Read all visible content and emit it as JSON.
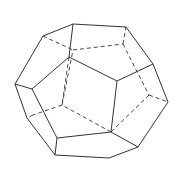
{
  "figure": {
    "title": "",
    "shape": "dodecahedron",
    "stroke_color": "#333333",
    "background": "#ffffff",
    "vertices": {
      "A": [
        43,
        36
      ],
      "B": [
        73,
        24
      ],
      "C": [
        126,
        27
      ],
      "D": [
        153,
        64
      ],
      "E": [
        168,
        102
      ],
      "F": [
        138,
        147
      ],
      "G": [
        109,
        158
      ],
      "H": [
        55,
        155
      ],
      "I": [
        27,
        118
      ],
      "J": [
        15,
        84
      ],
      "K": [
        69,
        57
      ],
      "L": [
        117,
        81
      ],
      "M": [
        111,
        132
      ],
      "N": [
        57,
        138
      ],
      "O": [
        32,
        89
      ],
      "P": [
        73,
        50
      ],
      "Q": [
        123,
        44
      ],
      "R": [
        149,
        95
      ],
      "S": [
        62,
        105
      ],
      "T": [
        33,
        115
      ]
    },
    "solid_edges": [
      [
        "A",
        "B"
      ],
      [
        "B",
        "C"
      ],
      [
        "C",
        "D"
      ],
      [
        "D",
        "E"
      ],
      [
        "E",
        "F"
      ],
      [
        "F",
        "G"
      ],
      [
        "G",
        "H"
      ],
      [
        "H",
        "I"
      ],
      [
        "I",
        "J"
      ],
      [
        "J",
        "A"
      ],
      [
        "B",
        "K"
      ],
      [
        "K",
        "L"
      ],
      [
        "L",
        "D"
      ],
      [
        "L",
        "M"
      ],
      [
        "M",
        "F"
      ],
      [
        "M",
        "N"
      ],
      [
        "N",
        "H"
      ],
      [
        "N",
        "O"
      ],
      [
        "O",
        "J"
      ],
      [
        "O",
        "K"
      ]
    ],
    "hidden_edges": [
      [
        "A",
        "P"
      ],
      [
        "P",
        "Q"
      ],
      [
        "Q",
        "C"
      ],
      [
        "Q",
        "R"
      ],
      [
        "R",
        "E"
      ],
      [
        "R",
        "M"
      ],
      [
        "M",
        "S"
      ],
      [
        "S",
        "P"
      ],
      [
        "S",
        "T"
      ],
      [
        "T",
        "I"
      ],
      [
        "K",
        "S"
      ]
    ]
  }
}
